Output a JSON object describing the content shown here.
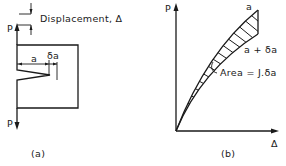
{
  "figure_a": {
    "caption": "(a)",
    "load_top_label": "P",
    "load_bottom_label": "P",
    "displacement_label": "Displacement, Δ",
    "crack_length_label": "a",
    "crack_increment_label": "δa"
  },
  "figure_b": {
    "caption": "(b)",
    "y_axis_label": "P",
    "x_axis_label": "Δ",
    "curve_upper_label": "a",
    "curve_lower_label": "a + δa",
    "area_label": "Area = J.δa"
  },
  "colors": {
    "ink": "#1a1a1a",
    "background": "#ffffff"
  }
}
